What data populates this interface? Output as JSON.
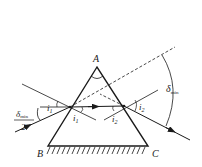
{
  "diagram": {
    "labels": {
      "apex": "A",
      "base_left": "B",
      "base_right": "C",
      "incidence_angle": "i",
      "incidence_sub": "1",
      "refraction_angle_1": "i",
      "refraction_sub_1": "1",
      "refraction_angle_2": "i",
      "refraction_sub_2": "2",
      "exit_angle": "i",
      "exit_sub": "2",
      "deviation": "δ",
      "deviation_sub": "min",
      "half_deviation": "δ",
      "half_deviation_sub": "min",
      "half_denominator": "2"
    },
    "colors": {
      "line": "#1a1a1a",
      "background": "#ffffff"
    }
  }
}
